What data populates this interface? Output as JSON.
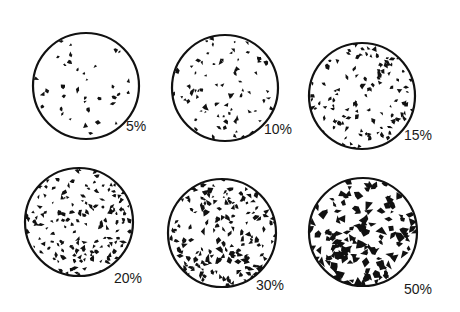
{
  "diagram": {
    "type": "percentage-area-comparison-chart",
    "ink_color": "#111111",
    "background": "#ffffff",
    "circles": [
      {
        "label": "5%",
        "percent": 5,
        "cx": 86,
        "cy": 86,
        "r": 53,
        "label_x": 126,
        "label_y": 119
      },
      {
        "label": "10%",
        "percent": 10,
        "cx": 225,
        "cy": 88,
        "r": 53,
        "label_x": 264,
        "label_y": 122
      },
      {
        "label": "15%",
        "percent": 15,
        "cx": 362,
        "cy": 96,
        "r": 53,
        "label_x": 404,
        "label_y": 128
      },
      {
        "label": "20%",
        "percent": 20,
        "cx": 79,
        "cy": 222,
        "r": 54,
        "label_x": 114,
        "label_y": 271
      },
      {
        "label": "30%",
        "percent": 30,
        "cx": 222,
        "cy": 233,
        "r": 54,
        "label_x": 256,
        "label_y": 278
      },
      {
        "label": "50%",
        "percent": 50,
        "cx": 363,
        "cy": 232,
        "r": 54,
        "label_x": 404,
        "label_y": 282
      }
    ]
  }
}
